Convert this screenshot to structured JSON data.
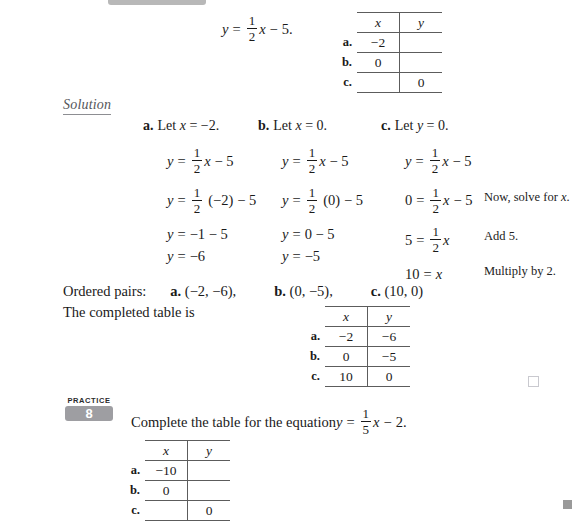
{
  "top": {
    "equation": {
      "lhs": "y",
      "eq": "=",
      "frac_num": "1",
      "frac_den": "2",
      "var": "x",
      "minus": "−",
      "const": "5."
    },
    "table": {
      "header_x": "x",
      "header_y": "y",
      "rows": [
        {
          "label": "a.",
          "x": "−2",
          "y": ""
        },
        {
          "label": "b.",
          "x": "0",
          "y": ""
        },
        {
          "label": "c.",
          "x": "",
          "y": "0"
        }
      ]
    }
  },
  "solution": {
    "heading": "Solution",
    "columns": [
      {
        "label": "a.",
        "let": "Let x = −2.",
        "let_prefix": "Let ",
        "let_var": "x",
        "let_rest": " = −2.",
        "lines": [
          {
            "lhs": "y",
            "rel": "=",
            "type": "frac_x",
            "num": "1",
            "den": "2",
            "var": "x",
            "tail": "− 5"
          },
          {
            "lhs": "y",
            "rel": "=",
            "type": "frac_paren",
            "num": "1",
            "den": "2",
            "paren": "(−2)",
            "tail": "− 5"
          },
          {
            "lhs": "y",
            "rel": "=",
            "type": "plain",
            "text": "−1 − 5"
          },
          {
            "lhs": "y",
            "rel": "=",
            "type": "plain",
            "text": "−6"
          }
        ]
      },
      {
        "label": "b.",
        "let_prefix": "Let ",
        "let_var": "x",
        "let_rest": " = 0.",
        "lines": [
          {
            "lhs": "y",
            "rel": "=",
            "type": "frac_x",
            "num": "1",
            "den": "2",
            "var": "x",
            "tail": "− 5"
          },
          {
            "lhs": "y",
            "rel": "=",
            "type": "frac_paren",
            "num": "1",
            "den": "2",
            "paren": "(0)",
            "tail": "− 5"
          },
          {
            "lhs": "y",
            "rel": "=",
            "type": "plain",
            "text": "0 − 5"
          },
          {
            "lhs": "y",
            "rel": "=",
            "type": "plain",
            "text": "−5"
          }
        ]
      },
      {
        "label": "c.",
        "let_prefix": "Let ",
        "let_var": "y",
        "let_rest": " = 0.",
        "lines": [
          {
            "lhs": "y",
            "rel": "=",
            "type": "frac_x",
            "num": "1",
            "den": "2",
            "var": "x",
            "tail": "− 5"
          },
          {
            "lhs": "0",
            "rel": "=",
            "type": "frac_x",
            "num": "1",
            "den": "2",
            "var": "x",
            "tail": "− 5"
          },
          {
            "lhs": "5",
            "rel": "=",
            "type": "frac_x",
            "num": "1",
            "den": "2",
            "var": "x",
            "tail": ""
          },
          {
            "lhs": "10",
            "rel": "=",
            "type": "plain_var",
            "var": "x"
          }
        ]
      }
    ],
    "annotations": [
      {
        "text_before": "Now, solve for ",
        "var": "x",
        "text_after": "."
      },
      {
        "text_before": "Add 5.",
        "var": "",
        "text_after": ""
      },
      {
        "text_before": "Multiply by 2.",
        "var": "",
        "text_after": ""
      }
    ]
  },
  "ordered_pairs": {
    "label": "Ordered pairs:",
    "items": [
      {
        "label": "a.",
        "value": "(−2, −6),"
      },
      {
        "label": "b.",
        "value": "(0, −5),"
      },
      {
        "label": "c.",
        "value": "(10, 0)"
      }
    ]
  },
  "completed_table": {
    "caption": "The completed table is",
    "header_x": "x",
    "header_y": "y",
    "rows": [
      {
        "label": "a.",
        "x": "−2",
        "y": "−6"
      },
      {
        "label": "b.",
        "x": "0",
        "y": "−5"
      },
      {
        "label": "c.",
        "x": "10",
        "y": "0"
      }
    ]
  },
  "practice": {
    "word": "PRACTICE",
    "number": "8",
    "instruction_prefix": "Complete the table for the equation ",
    "equation": {
      "lhs": "y",
      "eq": "=",
      "frac_num": "1",
      "frac_den": "5",
      "var": "x",
      "minus": "−",
      "const": "2."
    },
    "table": {
      "header_x": "x",
      "header_y": "y",
      "rows": [
        {
          "label": "a.",
          "x": "−10",
          "y": ""
        },
        {
          "label": "b.",
          "x": "0",
          "y": ""
        },
        {
          "label": "c.",
          "x": "",
          "y": "0"
        }
      ]
    }
  },
  "markers": {
    "end_of_example": "□",
    "page_marker": "■"
  },
  "colors": {
    "badge_gray": "#9e9ea2",
    "rule_gray": "#5c5c5c",
    "solution_gray": "#55565a",
    "top_bar_gray": "#b8b8b8"
  }
}
